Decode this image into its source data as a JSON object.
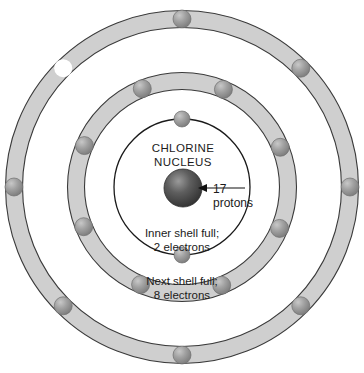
{
  "diagram": {
    "center": {
      "x": 182,
      "y": 187
    },
    "colors": {
      "background": "#ffffff",
      "band_fill": "#cfcfcf",
      "band_stroke": "#3a3a3a",
      "shell_line": "#1a1a1a",
      "electron_light": "#b9b9b9",
      "electron_mid": "#8f8f8f",
      "electron_dark": "#6e6e6e",
      "electron_empty": "#ffffff",
      "nucleus_light": "#8d8d8d",
      "nucleus_dark": "#2f2f2f",
      "text": "#1b1b1b"
    },
    "nucleus": {
      "label_line_1": "CHLORINE",
      "label_line_2": "NUCLEUS",
      "radius": 19,
      "callout_line_1": "17",
      "callout_line_2": "protons"
    },
    "annotations": [
      {
        "name": "inner-shell-note",
        "line_1": "Inner shell full;",
        "line_2": "2 electrons"
      },
      {
        "name": "next-shell-note",
        "line_1": "Next shell full;",
        "line_2": "8 electrons"
      }
    ],
    "shells": [
      {
        "name": "inner-shell",
        "index": 1,
        "style": "line",
        "radius": 68,
        "band_width": 0,
        "electron_count": 2,
        "electron_radius": 8,
        "electrons": [
          {
            "angle_deg": 90,
            "filled": true
          },
          {
            "angle_deg": 270,
            "filled": true
          }
        ]
      },
      {
        "name": "middle-shell",
        "index": 2,
        "style": "band",
        "radius": 106,
        "band_width": 17,
        "electron_count": 8,
        "electron_radius": 9,
        "electrons": [
          {
            "angle_deg": 67,
            "filled": true
          },
          {
            "angle_deg": 112,
            "filled": true
          },
          {
            "angle_deg": 157,
            "filled": true
          },
          {
            "angle_deg": 202,
            "filled": true
          },
          {
            "angle_deg": 247,
            "filled": true
          },
          {
            "angle_deg": 292,
            "filled": true
          },
          {
            "angle_deg": 337,
            "filled": true
          },
          {
            "angle_deg": 22,
            "filled": true
          }
        ]
      },
      {
        "name": "outer-shell",
        "index": 3,
        "style": "band",
        "radius": 168,
        "band_width": 17,
        "electron_count": 8,
        "electron_radius": 9,
        "electrons": [
          {
            "angle_deg": 90,
            "filled": true
          },
          {
            "angle_deg": 135,
            "filled": false
          },
          {
            "angle_deg": 180,
            "filled": true
          },
          {
            "angle_deg": 225,
            "filled": true
          },
          {
            "angle_deg": 270,
            "filled": true
          },
          {
            "angle_deg": 315,
            "filled": true
          },
          {
            "angle_deg": 0,
            "filled": true
          },
          {
            "angle_deg": 45,
            "filled": true
          }
        ]
      }
    ],
    "text_positions": {
      "nucleus_label_1": {
        "x": 183,
        "y": 152
      },
      "nucleus_label_2": {
        "x": 183,
        "y": 166
      },
      "callout_1": {
        "x": 213,
        "y": 193
      },
      "callout_2": {
        "x": 213,
        "y": 207
      },
      "inner_note_1": {
        "x": 182,
        "y": 237
      },
      "inner_note_2": {
        "x": 182,
        "y": 251
      },
      "next_note_1": {
        "x": 182,
        "y": 285
      },
      "next_note_2": {
        "x": 182,
        "y": 299
      }
    },
    "leader": {
      "from_x": 245,
      "to_x": 198,
      "y": 188
    }
  }
}
